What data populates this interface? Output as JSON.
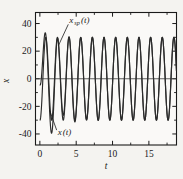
{
  "chart_data": {
    "type": "line",
    "title": "",
    "xlabel": "t",
    "ylabel": "x",
    "xlim": [
      -0.6,
      18.8
    ],
    "ylim": [
      -48,
      48
    ],
    "grid": false,
    "legend_position": "inline-annotation",
    "xticks": [
      0,
      5,
      10,
      15
    ],
    "xtick_labels": [
      "0",
      "5",
      "10",
      "15"
    ],
    "x_minor_ticks": [
      2.5,
      7.5,
      12.5,
      17.5
    ],
    "yticks": [
      40,
      20,
      0,
      -20,
      -40
    ],
    "ytick_labels": [
      "40",
      "20",
      "0",
      "-20",
      "-40"
    ],
    "y_minor_ticks": [
      30,
      10,
      -10,
      -30
    ],
    "annotations": [
      {
        "name": "x_sp-label",
        "text_main": "x",
        "text_sub": "sp",
        "text_tail": "(t)",
        "x": 4.05,
        "y": 40.5,
        "leader_to_x": 2.55,
        "leader_to_y": 24.0
      },
      {
        "name": "x-label",
        "text_main": "x",
        "text_sub": "",
        "text_tail": "(t)",
        "x": 2.45,
        "y": -40.5,
        "leader_to_x": 1.35,
        "leader_to_y": -23.0
      }
    ],
    "series": [
      {
        "name": "x_sp(t)",
        "label": "x_sp(t)",
        "color": "#2b2b2b",
        "description": "steady-state periodic response, amplitude 30, angular frequency 3.92 rad/s, phase -1.62 rad",
        "amplitude": 30,
        "omega": 3.92,
        "phase": -1.62,
        "offset": 0
      },
      {
        "name": "x(t)",
        "label": "x(t)",
        "color": "#2b2b2b",
        "description": "total response: steady-state plus decaying transient; converges to x_sp(t) after roughly t = 6",
        "amplitude": 30,
        "omega": 3.92,
        "phase": -1.62,
        "offset": 0,
        "transient_amplitude": 26,
        "transient_decay": 0.62,
        "transient_omega": 1.95,
        "transient_phase": 1.42
      }
    ]
  }
}
